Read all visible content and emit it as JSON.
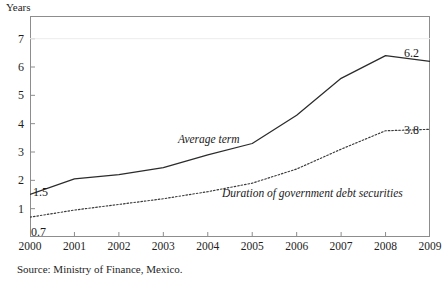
{
  "axis_unit_label": "Years",
  "source_note": "Source: Ministry of Finance, Mexico.",
  "annotations": {
    "start_average": "1.5",
    "start_duration": "0.7",
    "end_average": "6.2",
    "end_duration": "3.8"
  },
  "colors": {
    "line": "#2b2b2b",
    "axis": "#8d8d8d",
    "text": "#1a1a1a",
    "background": "#ffffff"
  },
  "chart_data": {
    "type": "line",
    "title": "",
    "xlabel": "",
    "ylabel": "Years",
    "categories": [
      "2000",
      "2001",
      "2002",
      "2003",
      "2004",
      "2005",
      "2006",
      "2007",
      "2008",
      "2009"
    ],
    "x": [
      2000,
      2001,
      2002,
      2003,
      2004,
      2005,
      2006,
      2007,
      2008,
      2009
    ],
    "xlim": [
      2000,
      2009
    ],
    "ylim": [
      0,
      7.8
    ],
    "yticks": [
      1,
      2,
      3,
      4,
      5,
      6,
      7
    ],
    "ytick_labels": [
      "1",
      "2",
      "3",
      "4",
      "5",
      "6",
      "7"
    ],
    "grid": false,
    "legend": "in-plot annotations",
    "series": [
      {
        "name": "Average term",
        "style": "solid",
        "values": [
          1.5,
          2.05,
          2.2,
          2.45,
          2.9,
          3.3,
          4.3,
          5.6,
          6.4,
          6.2
        ],
        "endpoint_labels": {
          "first": "1.5",
          "last": "6.2"
        }
      },
      {
        "name": "Duration of government debt securities",
        "style": "dotted",
        "values": [
          0.7,
          0.95,
          1.15,
          1.35,
          1.6,
          1.9,
          2.4,
          3.1,
          3.75,
          3.8
        ],
        "endpoint_labels": {
          "first": "0.7",
          "last": "3.8"
        }
      }
    ]
  }
}
